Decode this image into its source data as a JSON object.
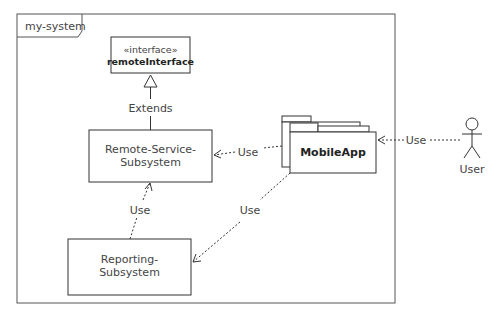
{
  "frame": {
    "name": "my-system"
  },
  "elements": {
    "interface": {
      "stereotype": "«interface»",
      "name": "remoteInterface"
    },
    "remote_service": {
      "line1": "Remote-Service-",
      "line2": "Subsystem"
    },
    "reporting": {
      "line1": "Reporting-",
      "line2": "Subsystem"
    },
    "mobile_app": {
      "name": "MobileApp"
    },
    "actor": {
      "name": "User"
    }
  },
  "relations": [
    {
      "from": "Remote-Service-Subsystem",
      "to": "remoteInterface",
      "label": "Extends",
      "type": "generalization"
    },
    {
      "from": "MobileApp",
      "to": "Remote-Service-Subsystem",
      "label": "Use",
      "type": "dependency"
    },
    {
      "from": "Reporting-Subsystem",
      "to": "Remote-Service-Subsystem",
      "label": "Use",
      "type": "dependency"
    },
    {
      "from": "MobileApp",
      "to": "Reporting-Subsystem",
      "label": "Use",
      "type": "dependency"
    },
    {
      "from": "User",
      "to": "MobileApp",
      "label": "Use",
      "type": "dependency"
    }
  ],
  "colors": {
    "stroke": "#333333",
    "text": "#444444",
    "background": "#ffffff"
  }
}
